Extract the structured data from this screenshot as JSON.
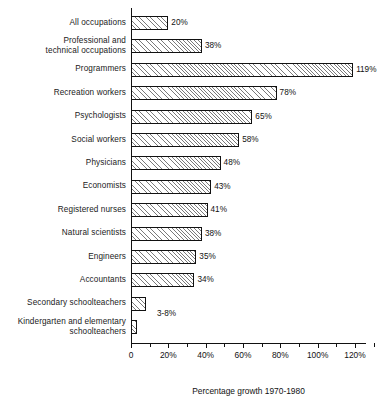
{
  "chart_data": {
    "type": "bar",
    "orientation": "horizontal",
    "title": "",
    "xlabel": "Percentage growth 1970-1980",
    "ylabel": "",
    "xlim": [
      0,
      126
    ],
    "grid": false,
    "legend": null,
    "xtick_labels": [
      "0",
      "20%",
      "40%",
      "60%",
      "80%",
      "100%",
      "120%"
    ],
    "xtick_values": [
      0,
      20,
      40,
      60,
      80,
      100,
      120
    ],
    "minor_tick_step": 10,
    "categories": [
      "All occupations",
      "Professional and technical occupations",
      "Programmers",
      "Recreation workers",
      "Psychologists",
      "Social workers",
      "Physicians",
      "Economists",
      "Registered nurses",
      "Natural scientists",
      "Engineers",
      "Accountants",
      "Secondary schoolteachers",
      "Kindergarten and elementary schoolteachers"
    ],
    "values": [
      20,
      38,
      119,
      78,
      65,
      58,
      48,
      43,
      41,
      38,
      35,
      34,
      8,
      3
    ],
    "data_labels": [
      "20%",
      "38%",
      "119%",
      "78%",
      "65%",
      "58%",
      "48%",
      "43%",
      "41%",
      "38%",
      "35%",
      "34%",
      "",
      "3-8%"
    ],
    "shared_label": {
      "text": "3-8%",
      "applies_to": [
        "Secondary schoolteachers",
        "Kindergarten and elementary schoolteachers"
      ]
    },
    "style": {
      "bar_fill": "#ffffff",
      "bar_hatch": "diagonal-lines",
      "bar_hatch_color": "#7a7a7a",
      "bar_edge_color": "#111111",
      "background": "#ffffff",
      "text_color": "#111111"
    }
  },
  "rows": [
    {
      "label_line1": "All occupations",
      "label_line2": "",
      "value": 20,
      "data_label": "20%"
    },
    {
      "label_line1": "Professional and",
      "label_line2": "technical occupations",
      "value": 38,
      "data_label": "38%"
    },
    {
      "label_line1": "Programmers",
      "label_line2": "",
      "value": 119,
      "data_label": "119%"
    },
    {
      "label_line1": "Recreation workers",
      "label_line2": "",
      "value": 78,
      "data_label": "78%"
    },
    {
      "label_line1": "Psychologists",
      "label_line2": "",
      "value": 65,
      "data_label": "65%"
    },
    {
      "label_line1": "Social workers",
      "label_line2": "",
      "value": 58,
      "data_label": "58%"
    },
    {
      "label_line1": "Physicians",
      "label_line2": "",
      "value": 48,
      "data_label": "48%"
    },
    {
      "label_line1": "Economists",
      "label_line2": "",
      "value": 43,
      "data_label": "43%"
    },
    {
      "label_line1": "Registered nurses",
      "label_line2": "",
      "value": 41,
      "data_label": "41%"
    },
    {
      "label_line1": "Natural scientists",
      "label_line2": "",
      "value": 38,
      "data_label": "38%"
    },
    {
      "label_line1": "Engineers",
      "label_line2": "",
      "value": 35,
      "data_label": "35%"
    },
    {
      "label_line1": "Accountants",
      "label_line2": "",
      "value": 34,
      "data_label": "34%"
    },
    {
      "label_line1": "Secondary schoolteachers",
      "label_line2": "",
      "value": 8,
      "data_label": ""
    },
    {
      "label_line1": "Kindergarten and elementary",
      "label_line2": "schoolteachers",
      "value": 3,
      "data_label": "3-8%"
    }
  ],
  "axis": {
    "title": "Percentage growth 1970-1980",
    "ticks": [
      "0",
      "20%",
      "40%",
      "60%",
      "80%",
      "100%",
      "120%"
    ]
  }
}
